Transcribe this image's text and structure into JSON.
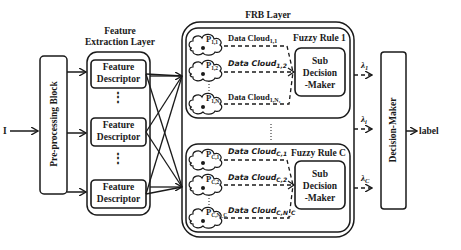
{
  "input": {
    "label": "I"
  },
  "preprocessing": {
    "label": "Pre-processing Block"
  },
  "feature_layer": {
    "title_line1": "Feature",
    "title_line2": "Extraction Layer",
    "descriptors": [
      {
        "line1": "Feature",
        "line2": "Descriptor"
      },
      {
        "line1": "Feature",
        "line2": "Descriptor"
      },
      {
        "line1": "Feature",
        "line2": "Descriptor"
      }
    ],
    "ellipsis": "⋮"
  },
  "frb_layer": {
    "title": "FRB Layer",
    "rules": [
      {
        "title": "Fuzzy Rule 1",
        "sub_decision": {
          "line1": "Sub",
          "line2": "Decision",
          "line3": "-Maker"
        },
        "clouds": [
          {
            "prototype": "P",
            "p_sub": "1,1",
            "label": "Data Cloud",
            "label_sub": "1,1",
            "italic": false
          },
          {
            "prototype": "P",
            "p_sub": "1,2",
            "label": "Data Cloud",
            "label_sub": "1,2",
            "italic": true
          },
          {
            "prototype": "P",
            "p_sub": "1,N₁",
            "label": "Data Cloud",
            "label_sub": "1,N₁",
            "italic": false
          }
        ],
        "output": {
          "symbol": "λ",
          "sub": "1"
        }
      },
      {
        "title": "Fuzzy Rule C",
        "sub_decision": {
          "line1": "Sub",
          "line2": "Decision",
          "line3": "-Maker"
        },
        "clouds": [
          {
            "prototype": "P",
            "p_sub": "C,1",
            "label": "Data Cloud",
            "label_sub": "C,1",
            "italic": true
          },
          {
            "prototype": "P",
            "p_sub": "C,2",
            "label": "Data Cloud",
            "label_sub": "C,2",
            "italic": true
          },
          {
            "prototype": "P",
            "p_sub": "C,N_C",
            "label": "Data Cloud",
            "label_sub": "C,N_C",
            "italic": true
          }
        ],
        "output": {
          "symbol": "λ",
          "sub": "C"
        }
      }
    ],
    "middle_output": {
      "symbol": "λ",
      "sub": "i"
    },
    "ellipsis": "⋮"
  },
  "decision_maker": {
    "label": "Decision-Maker"
  },
  "output": {
    "label": "label"
  }
}
